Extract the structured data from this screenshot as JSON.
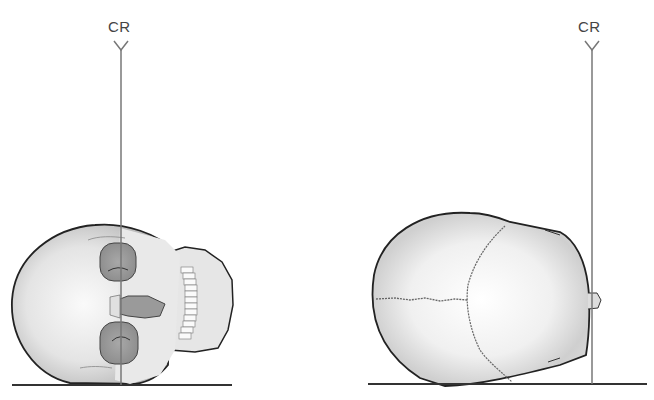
{
  "diagram": {
    "panels": [
      {
        "name": "skull-left-vertex-down-view",
        "central_ray_label": "CR",
        "cr_x": 121,
        "label_x": 108,
        "label_y": 18
      },
      {
        "name": "skull-right-top-view",
        "central_ray_label": "CR",
        "cr_x": 592,
        "label_x": 578,
        "label_y": 18
      }
    ],
    "colors": {
      "line": "#777777",
      "outline": "#222222",
      "bone_light": "#f2f2f2",
      "bone_shade": "#b8b8b8",
      "tabletop": "#333333"
    }
  }
}
